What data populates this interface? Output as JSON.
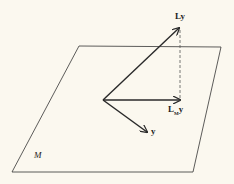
{
  "plane_label": "M",
  "vectors": {
    "Ly": "Ly",
    "LMy_main": "L",
    "LMy_sub": "M",
    "LMy_tail": "y",
    "y": "y"
  },
  "colors": {
    "line": "#2a2a2a",
    "background": "#fbf8ef"
  }
}
